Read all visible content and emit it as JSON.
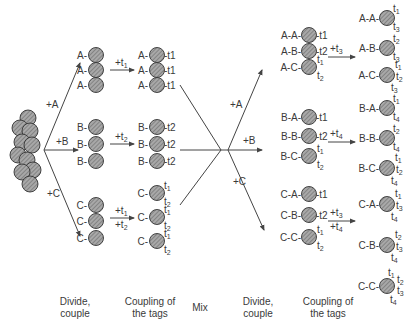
{
  "diagram": {
    "bead_fill": "#9a9a9a",
    "line_color": "#444444",
    "stage1": {
      "reagents": [
        "+A",
        "+B",
        "+C"
      ],
      "groups": [
        {
          "prefix": "A",
          "tag_step": "+t1",
          "tags": [
            "t1"
          ]
        },
        {
          "prefix": "B",
          "tag_step": "+t2",
          "tags": [
            "t2"
          ]
        },
        {
          "prefix": "C",
          "tag_step": "+t1 +t2",
          "tags": [
            "t1",
            "t2"
          ]
        }
      ]
    },
    "stage2": {
      "reagents": [
        "+A",
        "+B",
        "+C"
      ],
      "groups": [
        {
          "tag_step": "+t3",
          "items": [
            {
              "name": "A-A",
              "before": [
                "t1"
              ],
              "after": [
                "t1",
                "t3"
              ]
            },
            {
              "name": "A-B",
              "before": [
                "t2"
              ],
              "after": [
                "t2",
                "t3"
              ]
            },
            {
              "name": "A-C",
              "before": [
                "t1",
                "t2"
              ],
              "after": [
                "t1",
                "t2",
                "t3"
              ]
            }
          ]
        },
        {
          "tag_step": "+t4",
          "items": [
            {
              "name": "B-A",
              "before": [
                "t1"
              ],
              "after": [
                "t1",
                "t4"
              ]
            },
            {
              "name": "B-B",
              "before": [
                "t2"
              ],
              "after": [
                "t2",
                "t4"
              ]
            },
            {
              "name": "B-C",
              "before": [
                "t1",
                "t2"
              ],
              "after": [
                "t1",
                "t2",
                "t4"
              ]
            }
          ]
        },
        {
          "tag_step": "+t3 +t4",
          "items": [
            {
              "name": "C-A",
              "before": [
                "t1"
              ],
              "after": [
                "t1",
                "t3",
                "t4"
              ]
            },
            {
              "name": "C-B",
              "before": [
                "t2"
              ],
              "after": [
                "t2",
                "t3",
                "t4"
              ]
            },
            {
              "name": "C-C",
              "before": [
                "t1",
                "t2"
              ],
              "after": [
                "t1",
                "t2",
                "t3",
                "t4"
              ]
            }
          ]
        }
      ]
    },
    "step_labels": {
      "divide1": "Divide,\ncouple",
      "coupling1": "Coupling of\nthe tags",
      "mix": "Mix",
      "divide2": "Divide,\ncouple",
      "coupling2": "Coupling of\nthe tags"
    },
    "labels": {
      "divide1_l1": "Divide,",
      "divide1_l2": "couple",
      "coupling1_l1": "Coupling of",
      "coupling1_l2": "the tags",
      "mix": "Mix",
      "divide2_l1": "Divide,",
      "divide2_l2": "couple",
      "coupling2_l1": "Coupling of",
      "coupling2_l2": "the tags"
    }
  }
}
